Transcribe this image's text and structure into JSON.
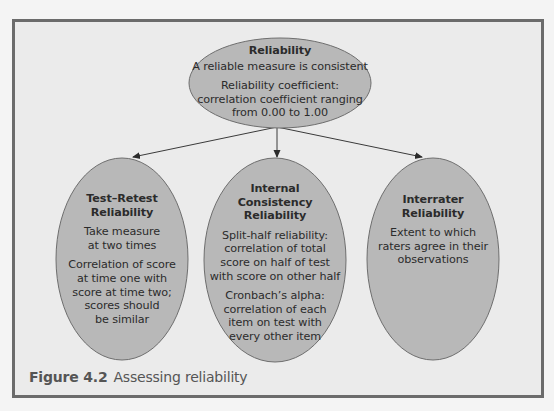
{
  "figure": {
    "caption_label": "Figure 4.2",
    "caption_text": "Assessing reliability",
    "colors": {
      "frame_background": "#ebebeb",
      "frame_border": "#6b6b6b",
      "ellipse_fill": "#b8b8b8",
      "ellipse_stroke": "#6e6e6e",
      "text": "#2b2b2b",
      "caption": "#555555"
    }
  },
  "root": {
    "title": "Reliability",
    "paragraphs": [
      "A reliable measure is consistent",
      "Reliability coefficient:\ncorrelation coefficient ranging\nfrom 0.00 to 1.00"
    ]
  },
  "children": [
    {
      "title": "Test–Retest\nReliability",
      "paragraphs": [
        "Take measure\nat two times",
        "Correlation of score\nat time one with\nscore at time two;\nscores should\nbe similar"
      ]
    },
    {
      "title": "Internal\nConsistency\nReliability",
      "paragraphs": [
        "Split-half reliability:\ncorrelation of total\nscore on half of test\nwith score on other half",
        "Cronbach’s alpha:\ncorrelation of each\nitem on test with\nevery other item"
      ]
    },
    {
      "title": "Interrater\nReliability",
      "paragraphs": [
        "Extent to which\nraters agree in their\nobservations"
      ]
    }
  ]
}
